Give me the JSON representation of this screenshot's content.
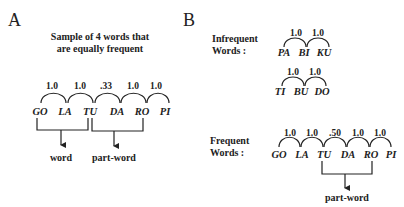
{
  "panels": {
    "a": {
      "label": "A",
      "title_line1": "Sample of 4 words that",
      "title_line2": "are equally frequent",
      "syllables": [
        "GO",
        "LA",
        "TU",
        "DA",
        "RO",
        "PI"
      ],
      "transitional_probabilities": [
        "1.0",
        "1.0",
        ".33",
        "1.0",
        "1.0"
      ],
      "brackets": [
        {
          "label": "word",
          "from": "GO",
          "to": "TU"
        },
        {
          "label": "part-word",
          "from": "TU",
          "to": "RO"
        }
      ]
    },
    "b": {
      "label": "B",
      "infrequent": {
        "label_line1": "Infrequent",
        "label_line2": "Words :",
        "word1": {
          "syllables": [
            "PA",
            "BI",
            "KU"
          ],
          "probabilities": [
            "1.0",
            "1.0"
          ]
        },
        "word2": {
          "syllables": [
            "TI",
            "BU",
            "DO"
          ],
          "probabilities": [
            "1.0",
            "1.0"
          ]
        }
      },
      "frequent": {
        "label_line1": "Frequent",
        "label_line2": "Words :",
        "syllables": [
          "GO",
          "LA",
          "TU",
          "DA",
          "RO",
          "PI"
        ],
        "transitional_probabilities": [
          "1.0",
          "1.0",
          ".50",
          "1.0",
          "1.0"
        ],
        "bracket": {
          "label": "part-word",
          "from": "TU",
          "to": "RO"
        }
      }
    }
  }
}
